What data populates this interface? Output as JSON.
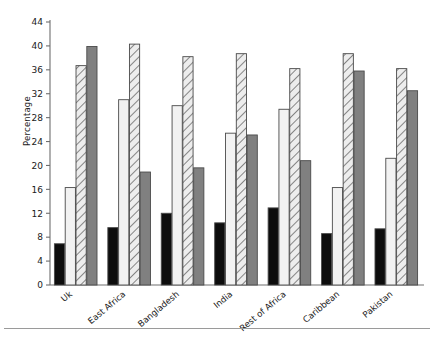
{
  "chart_data": {
    "type": "bar",
    "title": "",
    "subtitle": "",
    "xlabel": "",
    "ylabel": "Percentage",
    "ylim": [
      0,
      44
    ],
    "ytick_step": 4,
    "yticks": [
      0,
      4,
      8,
      12,
      16,
      20,
      24,
      28,
      32,
      36,
      40,
      44
    ],
    "grid": false,
    "legend": "none",
    "categories": [
      "Uk",
      "East Africa",
      "Bangladesh",
      "India",
      "Rest of Africa",
      "Caribbean",
      "Pakistan"
    ],
    "series": [
      {
        "name": "series-1-black",
        "style": "solid-black",
        "color": "#0d0d0d",
        "values": [
          6.9,
          9.6,
          12.0,
          10.4,
          12.9,
          8.6,
          9.4
        ]
      },
      {
        "name": "series-2-white",
        "style": "solid-white",
        "color": "#f2f2f2",
        "values": [
          16.3,
          31.0,
          30.0,
          25.4,
          29.4,
          16.3,
          21.2
        ]
      },
      {
        "name": "series-3-hatched",
        "style": "diagonal-hatch",
        "color": "#e8e8e8",
        "values": [
          36.7,
          40.3,
          38.2,
          38.7,
          36.2,
          38.7,
          36.2
        ]
      },
      {
        "name": "series-4-gray",
        "style": "solid-gray",
        "color": "#808080",
        "values": [
          39.9,
          18.9,
          19.6,
          25.1,
          20.8,
          35.8,
          32.5
        ]
      }
    ]
  },
  "axis": {
    "y_axis_label": "Percentage",
    "tick_labels": [
      "0",
      "4",
      "8",
      "12",
      "16",
      "20",
      "24",
      "28",
      "32",
      "36",
      "40",
      "44"
    ]
  },
  "colors": {
    "black_bar": "#0d0d0d",
    "white_bar": "#f2f2f2",
    "hatch_bar": "#e8e8e8",
    "gray_bar": "#808080",
    "bar_outline": "#4a4a4a",
    "axis_line": "#6e6e6e",
    "rule": "#9a9a9a"
  }
}
